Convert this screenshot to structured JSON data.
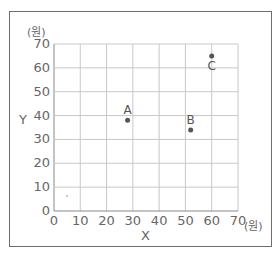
{
  "chart_data": {
    "type": "scatter",
    "title": "",
    "xlabel": "X",
    "ylabel": "Y",
    "x_unit": "(원)",
    "y_unit": "(원)",
    "xlim": [
      0,
      70
    ],
    "ylim": [
      0,
      70
    ],
    "x_ticks": [
      "0",
      "10",
      "20",
      "30",
      "40",
      "50",
      "60",
      "70"
    ],
    "y_ticks": [
      "0",
      "10",
      "20",
      "30",
      "40",
      "50",
      "60",
      "70"
    ],
    "grid": true,
    "legend": null,
    "points": [
      {
        "label": "A",
        "x": 28,
        "y": 38
      },
      {
        "label": "B",
        "x": 52,
        "y": 34
      },
      {
        "label": "C",
        "x": 60,
        "y": 65
      }
    ],
    "colors": {
      "grid": "#c8c8c8",
      "frame": "#6e6e6e",
      "point": "#555555"
    }
  }
}
